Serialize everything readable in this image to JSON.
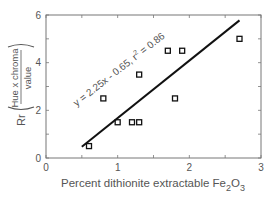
{
  "chart_data": {
    "type": "scatter",
    "title": "",
    "xlabel": "Percent dithionite extractable Fe2O3",
    "xlabel_parts": {
      "main": "Percent dithionite extractable Fe",
      "sub1": "2",
      "mid": "O",
      "sub2": "3"
    },
    "ylabel": "Rr (Hue x chroma / value)",
    "ylabel_parts": {
      "prefix": "Rr",
      "numerator": "Hue  x  chroma",
      "denominator": "value"
    },
    "xlim": [
      0,
      3
    ],
    "ylim": [
      0,
      6
    ],
    "x_ticks": [
      0,
      1,
      2,
      3
    ],
    "x_tick_labels": [
      "0",
      "1",
      "2",
      "3"
    ],
    "y_ticks": [
      0,
      2,
      4,
      6
    ],
    "y_tick_labels": [
      "0",
      "2",
      "4",
      "6"
    ],
    "x_minor_ticks": [
      0.5,
      1.5,
      2.5
    ],
    "y_minor_ticks": [
      1,
      3,
      5
    ],
    "grid": false,
    "legend": null,
    "series": [
      {
        "name": "observations",
        "marker": "open-square",
        "points": [
          {
            "x": 0.6,
            "y": 0.5
          },
          {
            "x": 0.8,
            "y": 2.5
          },
          {
            "x": 1.0,
            "y": 1.5
          },
          {
            "x": 1.2,
            "y": 1.5
          },
          {
            "x": 1.3,
            "y": 1.5
          },
          {
            "x": 1.3,
            "y": 3.5
          },
          {
            "x": 1.7,
            "y": 4.5
          },
          {
            "x": 1.8,
            "y": 2.5
          },
          {
            "x": 1.9,
            "y": 4.5
          },
          {
            "x": 2.7,
            "y": 5.0
          }
        ]
      }
    ],
    "regression": {
      "slope": 2.25,
      "intercept": -0.65,
      "r2": 0.86,
      "x_start": 0.5,
      "x_end": 2.7,
      "annotation": "y = 2.25x - 0.65,  r",
      "annotation_sup": "2",
      "annotation_tail": " = 0.86"
    }
  }
}
